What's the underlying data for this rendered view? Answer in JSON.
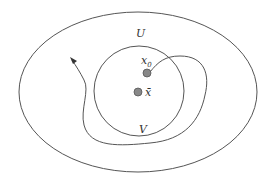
{
  "diagram": {
    "labels": {
      "outer_set": "U",
      "inner_set": "V",
      "start_point": "x",
      "start_point_subscript": "0",
      "center_point": "x̄"
    },
    "colors": {
      "stroke": "#555555",
      "point_fill": "#888888",
      "point_stroke": "#555555",
      "text": "#333333"
    }
  }
}
